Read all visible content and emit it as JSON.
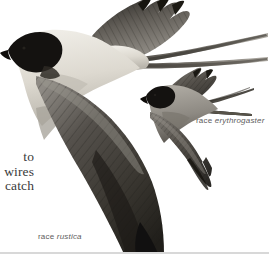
{
  "plate": {
    "title": "Barn Swallow in flight — two races",
    "background_color": "#ffffff",
    "width": 269,
    "height": 254
  },
  "body_text": {
    "lines": [
      "to",
      "wires",
      "catch"
    ],
    "note": "clipped column text at left margin",
    "color": "#3a3a3a"
  },
  "captions": [
    {
      "id": "erythrogaster",
      "prefix": "race ",
      "scientific": "erythrogaster",
      "color": "#5d5d5d"
    },
    {
      "id": "rustica",
      "prefix": "race ",
      "scientific": "rustica",
      "color": "#5d5d5d"
    }
  ],
  "figures": [
    {
      "name": "barn-swallow-rustica",
      "role": "large foreground bird",
      "facing": "left",
      "features": [
        "black cap",
        "pale underparts",
        "dark upperwing",
        "long forked tail streamers"
      ]
    },
    {
      "name": "barn-swallow-erythrogaster",
      "role": "small background bird",
      "facing": "left",
      "features": [
        "black cap",
        "darker underparts",
        "dark upperwing",
        "long forked tail streamers"
      ]
    }
  ],
  "palette": {
    "ink_black": "#14120f",
    "dark_wing": "#3f3c38",
    "mid_gray": "#6e6a64",
    "pale_gray": "#c9c6bf",
    "cream": "#e6e3da",
    "white": "#ffffff"
  }
}
